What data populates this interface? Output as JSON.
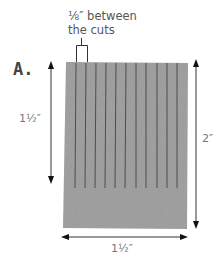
{
  "figure": {
    "letter": "A.",
    "callout": {
      "line1": "⅛″ between",
      "line2": "the cuts"
    },
    "dimensions": {
      "left_height": "1½″",
      "right_height": "2″",
      "bottom_width": "1½″"
    },
    "colors": {
      "fill": "#9b9b9b",
      "cut_line": "#4a4a4a",
      "arrow": "#222222",
      "text": "#666666"
    },
    "cut_count": 11
  }
}
